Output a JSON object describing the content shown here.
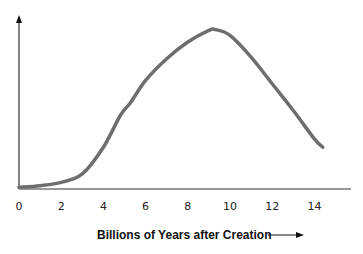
{
  "chart_data": {
    "type": "line",
    "title": "",
    "xlabel": "Billions of Years after Creation",
    "ylabel": "",
    "x_ticks": [
      "0",
      "2",
      "4",
      "6",
      "8",
      "10",
      "12",
      "14"
    ],
    "xlim": [
      0,
      15.5
    ],
    "ylim": [
      0,
      1
    ],
    "grid": false,
    "legend": null,
    "series": [
      {
        "name": "curve",
        "color": "#6e6e6e",
        "x": [
          0,
          1,
          2,
          3,
          4,
          4.8,
          5.3,
          6,
          7,
          8,
          9,
          9.3,
          10,
          11,
          12,
          13,
          14,
          14.4
        ],
        "y": [
          0.01,
          0.02,
          0.04,
          0.09,
          0.25,
          0.44,
          0.52,
          0.65,
          0.78,
          0.88,
          0.95,
          0.955,
          0.92,
          0.79,
          0.63,
          0.47,
          0.3,
          0.25
        ]
      }
    ]
  },
  "axis": {
    "x_arrow_label": "Billions of Years after Creation"
  }
}
